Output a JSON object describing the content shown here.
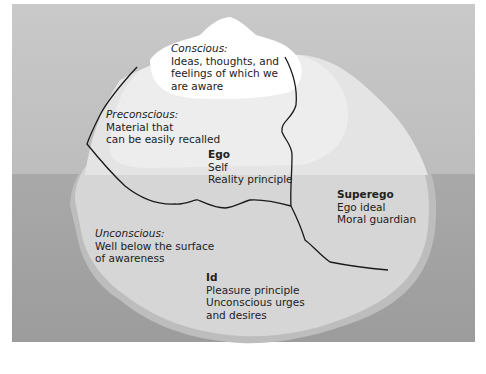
{
  "diagram": {
    "type": "iceberg-model-of-mind",
    "colors": {
      "sky": "#c6c6c6",
      "water": "#a3a3a3",
      "iceberg_above": "#e6e6e6",
      "iceberg_below": "#d3d3d3",
      "iceberg_tip": "#ffffff",
      "boundary_line": "#1a1a1a",
      "text": "#222222"
    },
    "labels": {
      "conscious": {
        "title": "Conscious:",
        "lines": [
          "Ideas, thoughts, and",
          "feelings of which we",
          "are aware"
        ]
      },
      "preconscious": {
        "title": "Preconscious:",
        "lines": [
          "Material that",
          "can be easily recalled"
        ]
      },
      "ego": {
        "title": "Ego",
        "lines": [
          "Self",
          "Reality principle"
        ]
      },
      "superego": {
        "title": "Superego",
        "lines": [
          "Ego ideal",
          "Moral guardian"
        ]
      },
      "unconscious": {
        "title": "Unconscious:",
        "lines": [
          "Well below the surface",
          "of awareness"
        ]
      },
      "id": {
        "title": "Id",
        "lines": [
          "Pleasure principle",
          "Unconscious urges",
          "and desires"
        ]
      }
    }
  }
}
